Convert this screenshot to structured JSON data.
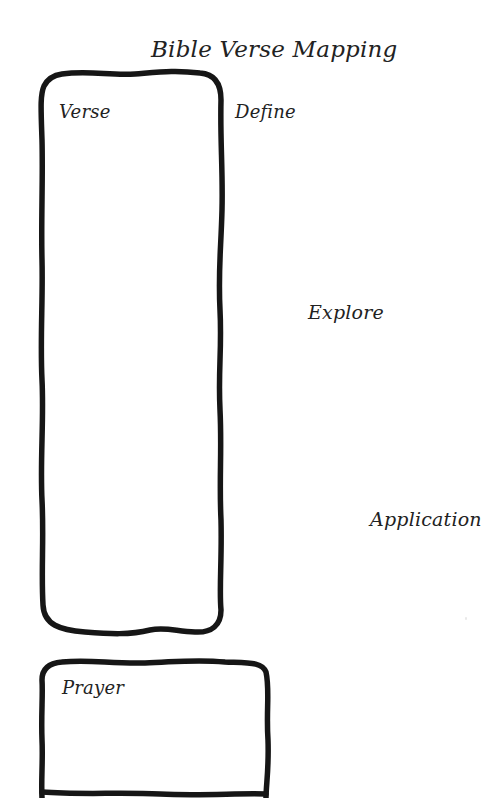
{
  "page": {
    "title": "Bible Verse Mapping",
    "background_color": "#ffffff",
    "ink_color": "#1a1a1a"
  },
  "sections": {
    "verse": {
      "label": "Verse"
    },
    "define": {
      "label": "Define"
    },
    "explore": {
      "label": "Explore"
    },
    "application": {
      "label": "Application"
    },
    "prayer": {
      "label": "Prayer"
    }
  }
}
